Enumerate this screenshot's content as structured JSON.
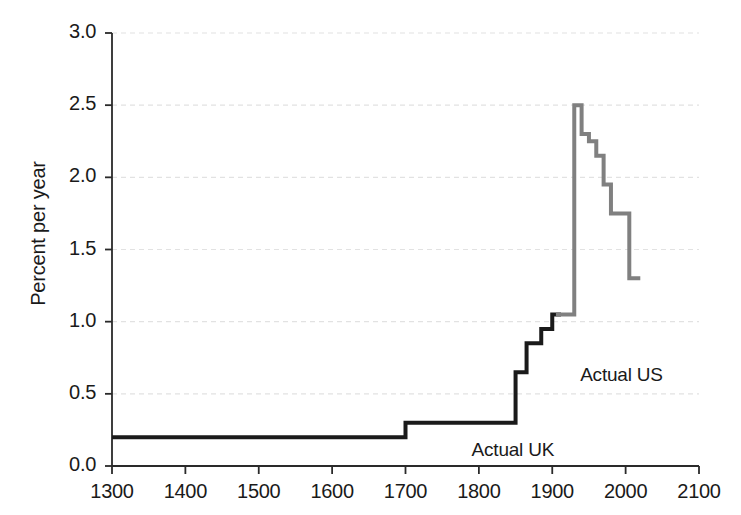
{
  "chart_data": {
    "type": "line",
    "title": "",
    "subtitle": "",
    "xlabel": "",
    "ylabel": "Percent per year",
    "xlim": [
      1300,
      2100
    ],
    "ylim": [
      0.0,
      3.0
    ],
    "xticks": [
      1300,
      1400,
      1500,
      1600,
      1700,
      1800,
      1900,
      2000,
      2100
    ],
    "xtick_labels": [
      "1300",
      "1400",
      "1500",
      "1600",
      "1700",
      "1800",
      "1900",
      "2000",
      "2100"
    ],
    "yticks": [
      0.0,
      0.5,
      1.0,
      1.5,
      2.0,
      2.5,
      3.0
    ],
    "ytick_labels": [
      "0.0",
      "0.5",
      "1.0",
      "1.5",
      "2.0",
      "2.5",
      "3.0"
    ],
    "grid": true,
    "grid_axis": "y",
    "grid_style": "dashed",
    "grid_color": "#e2e2e2",
    "legend_position": "inline-annotations",
    "drawstyle": "steps-post",
    "series": [
      {
        "name": "Actual UK",
        "color": "#1a1a1a",
        "linewidth": 4,
        "annotation": "Actual UK",
        "annotation_x": 1790,
        "annotation_y": 0.095,
        "x": [
          1300,
          1700,
          1850,
          1865,
          1885,
          1900,
          1912
        ],
        "y": [
          0.2,
          0.3,
          0.65,
          0.85,
          0.95,
          1.05,
          1.05
        ]
      },
      {
        "name": "Actual US",
        "color": "#808080",
        "linewidth": 4,
        "annotation": "Actual US",
        "annotation_x": 1938,
        "annotation_y": 0.62,
        "x": [
          1905,
          1905,
          1930,
          1940,
          1950,
          1960,
          1970,
          1980,
          2005,
          2020
        ],
        "y": [
          1.05,
          1.05,
          2.5,
          2.3,
          2.25,
          2.15,
          1.95,
          1.75,
          1.3,
          1.3
        ]
      }
    ]
  }
}
